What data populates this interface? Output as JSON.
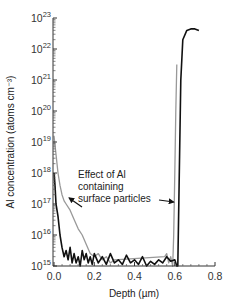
{
  "chart_data": {
    "type": "line",
    "title": "",
    "xlabel": "Depth (µm)",
    "ylabel": "Al concentration (atoms cm⁻³)",
    "xscale": "linear",
    "yscale": "log",
    "xlim": [
      0.0,
      0.8
    ],
    "ylim": [
      1000000000000000.0,
      1e+23
    ],
    "grid": false,
    "x_ticks": [
      "0.0",
      "0.2",
      "0.4",
      "0.6",
      "0.8"
    ],
    "y_ticks": [
      {
        "base": "10",
        "exp": "15"
      },
      {
        "base": "10",
        "exp": "16"
      },
      {
        "base": "10",
        "exp": "17"
      },
      {
        "base": "10",
        "exp": "18"
      },
      {
        "base": "10",
        "exp": "19"
      },
      {
        "base": "10",
        "exp": "20"
      },
      {
        "base": "10",
        "exp": "21"
      },
      {
        "base": "10",
        "exp": "22"
      },
      {
        "base": "10",
        "exp": "23"
      }
    ],
    "series": [
      {
        "name": "Black profile",
        "color": "#111111",
        "x": [
          0.0,
          0.005,
          0.01,
          0.02,
          0.03,
          0.04,
          0.05,
          0.06,
          0.07,
          0.08,
          0.09,
          0.1,
          0.11,
          0.12,
          0.13,
          0.14,
          0.15,
          0.16,
          0.17,
          0.18,
          0.19,
          0.2,
          0.22,
          0.24,
          0.26,
          0.28,
          0.3,
          0.32,
          0.34,
          0.36,
          0.38,
          0.4,
          0.42,
          0.44,
          0.46,
          0.48,
          0.5,
          0.52,
          0.54,
          0.56,
          0.58,
          0.6,
          0.61,
          0.615,
          0.62,
          0.625,
          0.63,
          0.64,
          0.66,
          0.68,
          0.7,
          0.72
        ],
        "y_log10": [
          18.0,
          17.6,
          17.0,
          16.6,
          16.0,
          15.6,
          15.3,
          15.5,
          15.2,
          15.6,
          15.1,
          15.4,
          15.1,
          15.3,
          15.0,
          15.5,
          15.2,
          15.4,
          15.1,
          15.3,
          15.05,
          15.4,
          15.1,
          15.3,
          15.05,
          15.4,
          15.1,
          15.2,
          15.05,
          15.35,
          15.1,
          15.2,
          15.05,
          15.3,
          15.0,
          15.15,
          15.05,
          15.2,
          15.1,
          15.3,
          15.15,
          15.2,
          15.0,
          15.0,
          17.0,
          19.0,
          21.0,
          22.3,
          22.6,
          22.65,
          22.65,
          22.6
        ]
      },
      {
        "name": "Gray profile (with Al-containing surface particles)",
        "color": "#999999",
        "x": [
          0.0,
          0.01,
          0.02,
          0.03,
          0.04,
          0.05,
          0.06,
          0.08,
          0.1,
          0.12,
          0.14,
          0.16,
          0.18,
          0.2,
          0.22,
          0.24,
          0.26,
          0.28,
          0.3,
          0.55,
          0.56,
          0.57,
          0.58,
          0.59,
          0.595,
          0.6,
          0.605,
          0.61
        ],
        "y_log10": [
          19.2,
          18.6,
          18.0,
          17.6,
          17.3,
          17.1,
          17.0,
          16.8,
          16.5,
          16.2,
          16.0,
          15.7,
          15.4,
          15.3,
          15.4,
          15.2,
          15.3,
          15.1,
          15.2,
          15.3,
          15.4,
          15.1,
          15.3,
          15.0,
          16.0,
          18.0,
          20.0,
          21.5
        ]
      }
    ],
    "annotations": [
      {
        "text_lines": [
          "Effect of Al",
          "containing",
          "surface particles"
        ],
        "arrows_to": [
          {
            "x": 0.06,
            "y_log10": 17.1
          },
          {
            "x": 0.59,
            "y_log10": 17.0
          }
        ]
      }
    ]
  }
}
